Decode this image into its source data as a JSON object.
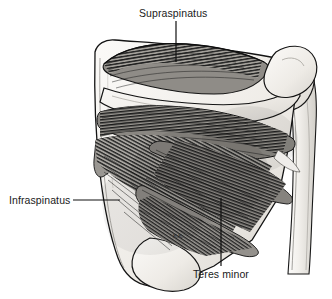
{
  "figure": {
    "kind": "anatomical-illustration",
    "background_color": "#ffffff",
    "ink_color": "#111111",
    "width": 332,
    "height": 299
  },
  "labels": {
    "supraspinatus": "Supraspinatus",
    "infraspinatus": "Infraspinatus",
    "teres_minor": "Teres minor"
  },
  "signature": {
    "artist_initials": "K.K."
  },
  "leaders": {
    "supraspinatus": {
      "orientation": "vertical",
      "x": 176,
      "y1": 21,
      "y2": 62
    },
    "infraspinatus": {
      "orientation": "horizontal",
      "y": 200,
      "x1": 73,
      "x2": 120
    },
    "teres_minor": {
      "orientation": "vertical",
      "x": 221,
      "y1": 198,
      "y2": 266
    }
  },
  "structures": {
    "scapula": "scapula",
    "scapular_spine": "spine-of-scapula",
    "acromion": "acromion",
    "humerus": "humerus",
    "supraspinatus_muscle": "supraspinatus-muscle",
    "infraspinatus_muscle": "infraspinatus-muscle",
    "teres_minor_muscle": "teres-minor-muscle"
  },
  "palette": {
    "bone_light": "#f2f0ec",
    "bone_shadow": "#cfccc6",
    "muscle_mid": "#8d8b86",
    "muscle_dark": "#3a3a38",
    "outline": "#141414"
  }
}
